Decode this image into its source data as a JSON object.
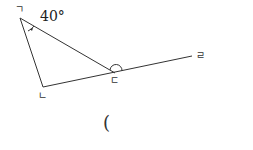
{
  "diagram": {
    "angle_label": "40°",
    "points": {
      "a": {
        "label": "ㄱ"
      },
      "b": {
        "label": "ㄴ"
      },
      "c": {
        "label": "ㄷ"
      },
      "d": {
        "label": "ㄹ"
      }
    },
    "answer_paren": "("
  }
}
